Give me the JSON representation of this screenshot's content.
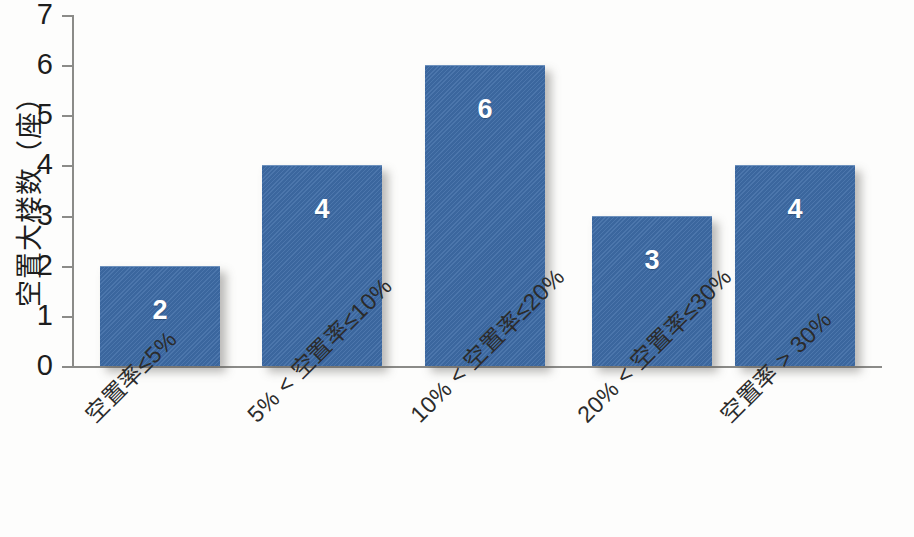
{
  "chart_data": {
    "type": "bar",
    "title": "",
    "xlabel": "",
    "ylabel": "空置大楼数（座）",
    "categories": [
      "空置率≤5%",
      "5% < 空置率≤10%",
      "10% < 空置率≤20%",
      "20% < 空置率≤30%",
      "空置率 > 30%"
    ],
    "values": [
      2,
      4,
      6,
      3,
      4
    ],
    "value_labels": [
      "2",
      "4",
      "6",
      "3",
      "4"
    ],
    "ylim": [
      0,
      7
    ],
    "ytick_labels": [
      "0",
      "1",
      "2",
      "3",
      "4",
      "5",
      "6",
      "7"
    ],
    "yticks": [
      0,
      1,
      2,
      3,
      4,
      5,
      6,
      7
    ],
    "grid": false,
    "legend": null,
    "bar_color": "#3e6ca6",
    "value_label_color": "#ffffff",
    "axis_color": "#8b8b88",
    "background_color": "#fdfdfc"
  }
}
